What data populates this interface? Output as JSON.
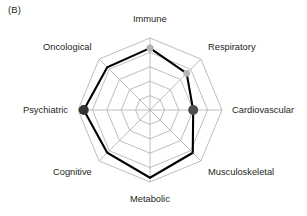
{
  "figure": {
    "panel_label": "(B)"
  },
  "chart_data": {
    "type": "radar",
    "title": "",
    "subtitle": "",
    "xlabel": "",
    "ylabel": "",
    "categories": [
      "Immune",
      "Respiratory",
      "Cardiovascular",
      "Musculoskeletal",
      "Metabolic",
      "Cognitive",
      "Psychiatric",
      "Oncological"
    ],
    "rings": 5,
    "rlim": [
      0,
      5
    ],
    "grid": true,
    "legend": "none",
    "series": [
      {
        "name": "Profile",
        "values": [
          4.3,
          3.6,
          3.0,
          4.2,
          4.7,
          4.2,
          4.6,
          4.2
        ],
        "line_color": "#000000",
        "line_width": 2.1,
        "fill": "none"
      }
    ],
    "markers": [
      {
        "category": "Immune",
        "value": 4.3,
        "color": "#b3b3b3",
        "radius": 3.6
      },
      {
        "category": "Respiratory",
        "value": 3.6,
        "color": "#b3b3b3",
        "radius": 3.4
      },
      {
        "category": "Cardiovascular",
        "value": 3.0,
        "color": "#4d4d4d",
        "radius": 5.0
      },
      {
        "category": "Psychiatric",
        "value": 4.6,
        "color": "#333333",
        "radius": 5.0
      }
    ],
    "colors": {
      "line": "#000000",
      "grid": "#a8a8a8",
      "spoke": "#a8a8a8",
      "marker_light": "#b3b3b3",
      "marker_dark": "#3b3b3b",
      "text": "#231f20",
      "background": "#ffffff"
    },
    "geometry": {
      "center_x": 150,
      "center_y": 110,
      "outer_radius": 72,
      "start_angle_deg": -90
    }
  },
  "labels": {
    "immune": "Immune",
    "respiratory": "Respiratory",
    "cardiovascular": "Cardiovascular",
    "musculoskeletal": "Musculoskeletal",
    "metabolic": "Metabolic",
    "cognitive": "Cognitive",
    "psychiatric": "Psychiatric",
    "oncological": "Oncological"
  }
}
